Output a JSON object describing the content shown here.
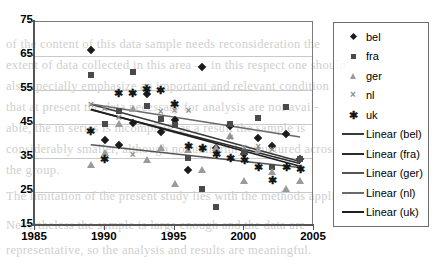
{
  "chart_data": {
    "type": "scatter",
    "title": "",
    "xlabel": "",
    "ylabel": "",
    "xlim": [
      1985,
      2005
    ],
    "ylim": [
      15,
      75
    ],
    "xticks": [
      1985,
      1990,
      1995,
      2000,
      2005
    ],
    "yticks": [
      15,
      25,
      35,
      45,
      55,
      65,
      75
    ],
    "grid": "horizontal",
    "legend_position": "right-outside",
    "series": [
      {
        "name": "bel",
        "marker": "diamond",
        "color": "#1a1a1a",
        "points": [
          [
            1989,
            66.8
          ],
          [
            1990,
            40.2
          ],
          [
            1991,
            38.7
          ],
          [
            1992,
            45.2
          ],
          [
            1993,
            53.9
          ],
          [
            1994,
            42.6
          ],
          [
            1995,
            46.2
          ],
          [
            1996,
            31.4
          ],
          [
            1997,
            61.8
          ],
          [
            1998,
            37.8
          ],
          [
            1999,
            44.4
          ],
          [
            2000,
            36.2
          ],
          [
            2001,
            41.0
          ],
          [
            2002,
            38.5
          ],
          [
            2003,
            42.2
          ],
          [
            2004,
            34.7
          ]
        ]
      },
      {
        "name": "fra",
        "marker": "square",
        "color": "#4a4a4a",
        "points": [
          [
            1989,
            59.4
          ],
          [
            1990,
            44.9
          ],
          [
            1991,
            48.9
          ],
          [
            1992,
            60.2
          ],
          [
            1993,
            50.2
          ],
          [
            1994,
            46.4
          ],
          [
            1995,
            44.8
          ],
          [
            1996,
            34.9
          ],
          [
            1997,
            26.0
          ],
          [
            1998,
            20.5
          ],
          [
            1999,
            45.0
          ],
          [
            2000,
            36.7
          ],
          [
            2001,
            46.8
          ],
          [
            2002,
            32.3
          ],
          [
            2003,
            50.0
          ],
          [
            2004,
            34.8
          ]
        ]
      },
      {
        "name": "ger",
        "marker": "triangle",
        "color": "#9a9a9a",
        "points": [
          [
            1989,
            32.8
          ],
          [
            1990,
            36.5
          ],
          [
            1991,
            45.1
          ],
          [
            1992,
            49.3
          ],
          [
            1993,
            34.4
          ],
          [
            1994,
            38.0
          ],
          [
            1995,
            27.3
          ],
          [
            1996,
            37.5
          ],
          [
            1997,
            31.5
          ],
          [
            1998,
            38.0
          ],
          [
            1999,
            41.4
          ],
          [
            2000,
            28.3
          ],
          [
            2001,
            37.5
          ],
          [
            2002,
            31.0
          ],
          [
            2003,
            25.9
          ],
          [
            2004,
            28.3
          ]
        ]
      },
      {
        "name": "nl",
        "marker": "x-thin",
        "color": "#8c8c8c",
        "points": [
          [
            1989,
            50.8
          ],
          [
            1990,
            49.8
          ],
          [
            1991,
            47.0
          ],
          [
            1992,
            36.2
          ],
          [
            1993,
            56.1
          ],
          [
            1994,
            48.9
          ],
          [
            1995,
            49.0
          ],
          [
            1996,
            49.2
          ],
          [
            1997,
            37.6
          ],
          [
            1998,
            36.4
          ],
          [
            1999,
            41.2
          ],
          [
            2000,
            38.3
          ],
          [
            2001,
            38.6
          ],
          [
            2002,
            37.7
          ],
          [
            2003,
            32.3
          ],
          [
            2004,
            32.0
          ]
        ]
      },
      {
        "name": "uk",
        "marker": "asterisk",
        "color": "#161616",
        "points": [
          [
            1989,
            42.9
          ],
          [
            1990,
            34.8
          ],
          [
            1991,
            54.0
          ],
          [
            1992,
            54.0
          ],
          [
            1993,
            55.2
          ],
          [
            1994,
            55.1
          ],
          [
            1995,
            51.0
          ],
          [
            1996,
            38.4
          ],
          [
            1997,
            38.0
          ],
          [
            1998,
            36.3
          ],
          [
            1999,
            35.0
          ],
          [
            2000,
            34.5
          ],
          [
            2001,
            32.4
          ],
          [
            2002,
            28.4
          ],
          [
            2003,
            32.4
          ],
          [
            2004,
            31.8
          ]
        ]
      }
    ],
    "trendlines": [
      {
        "name": "Linear (bel)",
        "x0": 1989,
        "y0": 50.8,
        "x1": 2004,
        "y1": 34.0,
        "color": "#3a3a3a"
      },
      {
        "name": "Linear (fra)",
        "x0": 1989,
        "y0": 49.2,
        "x1": 2004,
        "y1": 33.4,
        "color": "#2b2b2b"
      },
      {
        "name": "Linear (ger)",
        "x0": 1989,
        "y0": 38.9,
        "x1": 2004,
        "y1": 32.2,
        "color": "#555555"
      },
      {
        "name": "Linear (nl)",
        "x0": 1989,
        "y0": 50.9,
        "x1": 2004,
        "y1": 41.2,
        "color": "#6a6a6a"
      },
      {
        "name": "Linear (uk)",
        "x0": 1989,
        "y0": 49.3,
        "x1": 2004,
        "y1": 32.6,
        "color": "#1f1f1f"
      }
    ]
  },
  "legend": {
    "items": [
      {
        "label": "bel",
        "key": "diamond-marker"
      },
      {
        "label": "fra",
        "key": "square-marker"
      },
      {
        "label": "ger",
        "key": "triangle-marker"
      },
      {
        "label": "nl",
        "key": "x-marker"
      },
      {
        "label": "uk",
        "key": "asterisk-marker"
      },
      {
        "label": "Linear (bel)",
        "key": "line-swatch"
      },
      {
        "label": "Linear (fra)",
        "key": "line-swatch"
      },
      {
        "label": "Linear (ger)",
        "key": "line-swatch"
      },
      {
        "label": "Linear (nl)",
        "key": "line-swatch"
      },
      {
        "label": "Linear (uk)",
        "key": "line-swatch"
      }
    ]
  },
  "axes": {
    "y_ticks": [
      "75",
      "65",
      "55",
      "45",
      "35",
      "25",
      "15"
    ],
    "x_ticks": [
      "1985",
      "1990",
      "1995",
      "2000",
      "2005"
    ]
  },
  "background_text": [
    "of the content of this data sample needs reconsideration the",
    "extent of data collected in this area — in this respect one should",
    "also specially emphasize an important and relevant condition",
    "that at present the data necessary for analysis are not avail-",
    "able, the in series is incomplete, as a result the sample is",
    "considerably smaller, although not uniformly structured across",
    "the group.",
    "The limitation of the present study lies with the methods applied.",
    "Nevertheless the sample is large enough and the data are",
    "representative, so the analysis and results are meaningful."
  ]
}
